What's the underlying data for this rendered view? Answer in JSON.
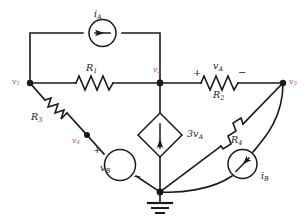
{
  "figure": {
    "kind": "circuit-schematic",
    "width": 307,
    "height": 224,
    "background": "#ffffff",
    "line_color": "#1a1a1a",
    "node_label_color": "#b4566e"
  },
  "nodes": [
    {
      "id": "v1",
      "label": "v",
      "sub": "1",
      "x": 30,
      "y": 83,
      "label_x": 12,
      "label_y": 78
    },
    {
      "id": "v2",
      "label": "v",
      "sub": "2",
      "x": 160,
      "y": 83,
      "label_x": 153,
      "label_y": 68
    },
    {
      "id": "v3",
      "label": "v",
      "sub": "3",
      "x": 283,
      "y": 83,
      "label_x": 288,
      "label_y": 78
    },
    {
      "id": "v4",
      "label": "v",
      "sub": "4",
      "x": 87,
      "y": 135,
      "label_x": 73,
      "label_y": 138
    }
  ],
  "components": [
    {
      "id": "iA",
      "type": "independent-current-source",
      "label": "i",
      "sub": "A",
      "label_x": 95,
      "label_y": 11,
      "arrow": "left"
    },
    {
      "id": "R1",
      "type": "resistor",
      "label": "R",
      "sub": "1",
      "label_x": 88,
      "label_y": 65
    },
    {
      "id": "R2",
      "type": "resistor",
      "label": "R",
      "sub": "2",
      "label_x": 215,
      "label_y": 92
    },
    {
      "id": "R3",
      "type": "resistor",
      "label": "R",
      "sub": "3",
      "label_x": 33,
      "label_y": 113
    },
    {
      "id": "R4",
      "type": "resistor",
      "label": "R",
      "sub": "4",
      "label_x": 228,
      "label_y": 138
    },
    {
      "id": "vA",
      "type": "voltage-label",
      "label": "v",
      "sub": "A",
      "label_x": 214,
      "label_y": 62
    },
    {
      "id": "vB",
      "type": "independent-voltage-source",
      "label": "v",
      "sub": "B",
      "label_x": 102,
      "label_y": 168
    },
    {
      "id": "iB",
      "type": "independent-current-source",
      "label": "i",
      "sub": "B",
      "label_x": 262,
      "label_y": 176,
      "arrow": "diagonal"
    },
    {
      "id": "dep",
      "type": "dependent-current-source",
      "label": "3v",
      "sub": "A",
      "label_x": 178,
      "label_y": 130,
      "arrow": "down"
    }
  ],
  "polarity_marks": [
    {
      "id": "vA-plus",
      "sign": "+",
      "x": 196,
      "y": 73
    },
    {
      "id": "vA-minus",
      "sign": "−",
      "x": 240,
      "y": 73
    },
    {
      "id": "vB-plus",
      "sign": "+",
      "x": 95,
      "y": 150
    },
    {
      "id": "vB-minus",
      "sign": "−",
      "x": 134,
      "y": 178
    }
  ],
  "ground": {
    "id": "ground",
    "x": 160,
    "y": 192,
    "label": ""
  }
}
